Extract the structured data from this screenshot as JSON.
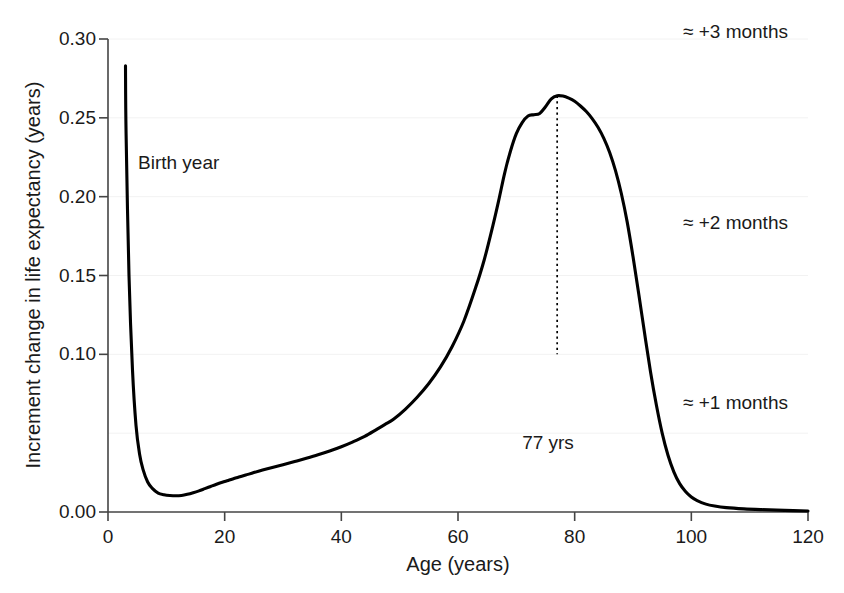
{
  "chart_data": {
    "type": "line",
    "title": "",
    "xlabel": "Age (years)",
    "ylabel": "Increment change in life expectancy (years)",
    "xlim": [
      0,
      120
    ],
    "ylim": [
      0.0,
      0.3
    ],
    "grid": true,
    "legend_position": "none",
    "xticks": [
      {
        "value": 0,
        "label": "0"
      },
      {
        "value": 20,
        "label": "20"
      },
      {
        "value": 40,
        "label": "40"
      },
      {
        "value": 60,
        "label": "60"
      },
      {
        "value": 80,
        "label": "80"
      },
      {
        "value": 100,
        "label": "100"
      },
      {
        "value": 120,
        "label": "120"
      }
    ],
    "yticks": [
      {
        "value": 0.0,
        "label": "0.00"
      },
      {
        "value": 0.1,
        "label": "0.10"
      },
      {
        "value": 0.15,
        "label": "0.15"
      },
      {
        "value": 0.2,
        "label": "0.20"
      },
      {
        "value": 0.25,
        "label": "0.25"
      },
      {
        "value": 0.3,
        "label": "0.30"
      }
    ],
    "series": [
      {
        "name": "Increment change in life expectancy",
        "x": [
          3.0,
          3.1,
          3.6,
          4.2,
          4.8,
          5.4,
          6.0,
          6.8,
          7.6,
          8.6,
          9.6,
          10.6,
          11.6,
          12.6,
          13.6,
          14.6,
          15.6,
          16.6,
          17.6,
          18.6,
          19.6,
          20.6,
          21.6,
          22.6,
          23.6,
          25.0,
          26.5,
          28.0,
          30.0,
          32.0,
          34.0,
          36.0,
          38.0,
          40.0,
          42.0,
          44.0,
          46.0,
          47.5,
          49.0,
          51.0,
          53.0,
          55.0,
          57.0,
          59.0,
          61.0,
          63.0,
          64.5,
          66.0,
          67.0,
          68.0,
          69.0,
          70.0,
          71.0,
          72.0,
          73.0,
          74.0,
          75.0,
          76.0,
          77.0,
          78.0,
          79.0,
          80.0,
          81.0,
          82.0,
          83.0,
          84.0,
          85.0,
          86.0,
          87.0,
          88.0,
          89.0,
          90.0,
          91.0,
          92.0,
          93.0,
          94.0,
          95.0,
          96.0,
          97.0,
          98.0,
          99.0,
          100.0,
          101.0,
          102.5,
          104.0,
          106.0,
          109.0,
          112.0,
          116.0,
          120.0
        ],
        "y": [
          0.283,
          0.24,
          0.15,
          0.09,
          0.055,
          0.037,
          0.027,
          0.019,
          0.015,
          0.012,
          0.011,
          0.0105,
          0.0103,
          0.0105,
          0.0112,
          0.0122,
          0.0134,
          0.0148,
          0.0162,
          0.0176,
          0.0189,
          0.02,
          0.0212,
          0.0223,
          0.0234,
          0.025,
          0.0266,
          0.0281,
          0.03,
          0.032,
          0.0341,
          0.0363,
          0.0387,
          0.0414,
          0.0445,
          0.048,
          0.0523,
          0.0556,
          0.059,
          0.0653,
          0.0728,
          0.0815,
          0.092,
          0.105,
          0.121,
          0.142,
          0.16,
          0.182,
          0.198,
          0.215,
          0.229,
          0.24,
          0.247,
          0.2512,
          0.252,
          0.2528,
          0.257,
          0.262,
          0.264,
          0.2638,
          0.2625,
          0.2605,
          0.2575,
          0.254,
          0.2495,
          0.244,
          0.237,
          0.228,
          0.2165,
          0.202,
          0.184,
          0.162,
          0.138,
          0.113,
          0.089,
          0.068,
          0.05,
          0.036,
          0.0255,
          0.018,
          0.013,
          0.0095,
          0.0072,
          0.005,
          0.0038,
          0.0028,
          0.002,
          0.0015,
          0.001,
          0.0006
        ],
        "color": "#000000"
      }
    ],
    "annotations": [
      {
        "id": "birth-year",
        "text": "Birth year",
        "x": 6.2,
        "y": 0.215
      },
      {
        "id": "peak-age",
        "text": "77 yrs",
        "x": 77,
        "y": 0.092
      },
      {
        "id": "months-3",
        "text": "≈ +3 months",
        "x": 121,
        "y": 0.298
      },
      {
        "id": "months-2",
        "text": "≈ +2 months",
        "x": 121,
        "y": 0.199
      },
      {
        "id": "months-1",
        "text": "≈ +1 months",
        "x": 121,
        "y": 0.105
      }
    ],
    "marker_line": {
      "label": "77 yrs",
      "x": 77,
      "y_top": 0.264,
      "y_bottom": 0.1,
      "style": "dotted"
    }
  },
  "axis_titles": {
    "x": "Age (years)",
    "y": "Increment change in life expectancy (years)"
  },
  "style": {
    "curve_color": "#000000",
    "axis_color": "#444444",
    "grid_color": "#f2f2f2",
    "text_color": "#1a1a1a",
    "background": "#ffffff"
  }
}
